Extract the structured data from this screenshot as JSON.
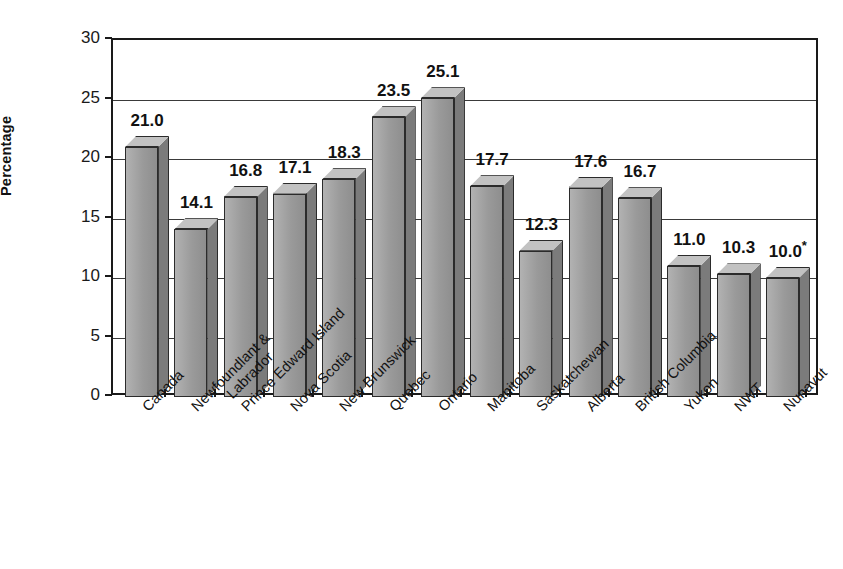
{
  "chart_data": {
    "type": "bar",
    "title": "",
    "xlabel": "",
    "ylabel": "Percentage",
    "ylim": [
      0,
      30
    ],
    "ytick_values": [
      30,
      25,
      20,
      15,
      10,
      5,
      0
    ],
    "ytick_labels": [
      "30",
      "25",
      "20",
      "15",
      "10",
      "5",
      "0"
    ],
    "grid": true,
    "legend": "none",
    "style": "3d-bar",
    "categories": [
      "Canada",
      "Newfoundlant & Labrador",
      "Prince Edward Island",
      "Nova Scotia",
      "New Brunswick",
      "Quebec",
      "Ontario",
      "Manitoba",
      "Saskatchewan",
      "Alberta",
      "British Columbia",
      "Yukon",
      "NWT",
      "Nunavut"
    ],
    "values": [
      21.0,
      14.1,
      16.8,
      17.1,
      18.3,
      23.5,
      25.1,
      17.7,
      12.3,
      17.6,
      16.7,
      11.0,
      10.3,
      10.0
    ],
    "data_labels": [
      "21.0",
      "14.1",
      "16.8",
      "17.1",
      "18.3",
      "23.5",
      "25.1",
      "17.7",
      "12.3",
      "17.6",
      "16.7",
      "11.0",
      "10.3",
      "10.0"
    ],
    "annotations": [
      {
        "category": "Nunavut",
        "marker": "*",
        "label": "10.0*"
      }
    ],
    "colors": {
      "bar_front": "#9d9d9d",
      "bar_side": "#7b7b7b",
      "bar_top": "#c2c2c2",
      "outline": "#2b2b2b",
      "axis": "#1a1a1a",
      "gridline": "#3a3a3a",
      "background": "#ffffff",
      "text": "#111111"
    }
  },
  "axis": {
    "y_title": "Percentage"
  },
  "x_labels": [
    {
      "line1": "Canada",
      "line2": ""
    },
    {
      "line1": "Newfoundlant &",
      "line2": "Labrador"
    },
    {
      "line1": "Prince Edward Island",
      "line2": ""
    },
    {
      "line1": "Nova Scotia",
      "line2": ""
    },
    {
      "line1": "New Brunswick",
      "line2": ""
    },
    {
      "line1": "Quebec",
      "line2": ""
    },
    {
      "line1": "Ontario",
      "line2": ""
    },
    {
      "line1": "Manitoba",
      "line2": ""
    },
    {
      "line1": "Saskatchewan",
      "line2": ""
    },
    {
      "line1": "Alberta",
      "line2": ""
    },
    {
      "line1": "British Columbia",
      "line2": ""
    },
    {
      "line1": "Yukon",
      "line2": ""
    },
    {
      "line1": "NWT",
      "line2": ""
    },
    {
      "line1": "Nunavut",
      "line2": ""
    }
  ]
}
